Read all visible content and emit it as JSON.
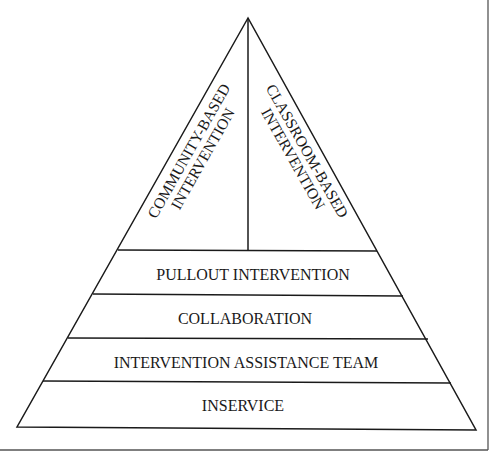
{
  "diagram": {
    "type": "pyramid",
    "colors": {
      "line": "#1a1a1a",
      "frame": "#555555",
      "background": "#ffffff"
    },
    "apex_sections": {
      "left": {
        "line1": "COMMUNITY-BASED",
        "line2": "INTERVENTION"
      },
      "right": {
        "line1": "CLASSROOM-BASED",
        "line2": "INTERVENTION"
      }
    },
    "tiers": [
      {
        "label": "PULLOUT INTERVENTION"
      },
      {
        "label": "COLLABORATION"
      },
      {
        "label": "INTERVENTION ASSISTANCE TEAM"
      },
      {
        "label": "INSERVICE"
      }
    ]
  }
}
